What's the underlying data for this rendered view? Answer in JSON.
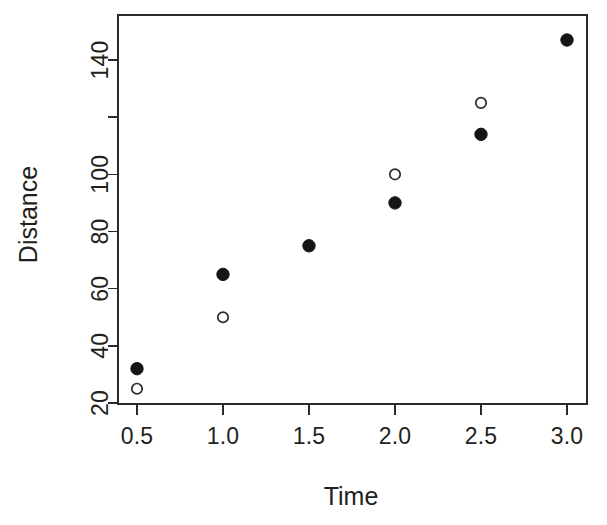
{
  "chart_data": {
    "type": "scatter",
    "title": "",
    "xlabel": "Time",
    "ylabel": "Distance",
    "xlim": [
      0.35,
      3.15
    ],
    "ylim": [
      20,
      147
    ],
    "grid": false,
    "legend": "none",
    "x_ticks": [
      0.5,
      1.0,
      1.5,
      2.0,
      2.5,
      3.0
    ],
    "x_tick_labels": [
      "0.5",
      "1.0",
      "1.5",
      "2.0",
      "2.5",
      "3.0"
    ],
    "y_ticks": [
      20,
      40,
      60,
      80,
      100,
      120,
      140
    ],
    "y_tick_labels": [
      "20",
      "40",
      "60",
      "80",
      "100",
      "",
      "140"
    ],
    "series": [
      {
        "name": "filled",
        "marker": "filled-circle",
        "color": "#151515",
        "x": [
          0.5,
          1.0,
          1.5,
          2.0,
          2.5,
          3.0
        ],
        "values": [
          32,
          65,
          75,
          90,
          114,
          147
        ]
      },
      {
        "name": "open",
        "marker": "open-circle",
        "color": "#2a2a2a",
        "x": [
          0.5,
          1.0,
          2.0,
          2.5
        ],
        "values": [
          25,
          50,
          100,
          125
        ]
      }
    ]
  },
  "colors": {
    "axis": "#2b2b2b",
    "text": "#231f20",
    "background": "#ffffff"
  }
}
